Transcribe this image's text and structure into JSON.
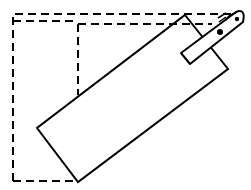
{
  "diagram": {
    "colors": {
      "stroke": "#000000",
      "background": "#ffffff"
    },
    "elements": [
      {
        "name": "original-position-outline",
        "style": "dashed"
      },
      {
        "name": "inner-position-outline",
        "style": "dashed"
      },
      {
        "name": "rotated-slab",
        "style": "solid"
      },
      {
        "name": "handle-strip",
        "style": "solid"
      },
      {
        "name": "pivot-points",
        "count": 2
      }
    ]
  }
}
